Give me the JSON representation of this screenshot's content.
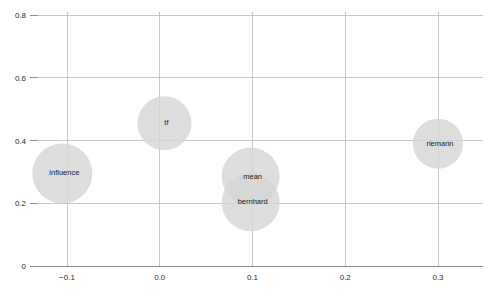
{
  "chart_data": {
    "type": "scatter",
    "title": "",
    "xlabel": "",
    "ylabel": "",
    "xlim": [
      -0.145,
      0.345
    ],
    "ylim": [
      0,
      0.845
    ],
    "grid": true,
    "legend": "none",
    "x_ticks": [
      -0.1,
      0.0,
      0.1,
      0.2,
      0.3
    ],
    "x_tick_labels": [
      "−0.1",
      "0.0",
      "0.1",
      "0.2",
      "0.3"
    ],
    "y_ticks": [
      0,
      0.2,
      0.4,
      0.6,
      0.8
    ],
    "y_tick_labels": [
      "0",
      "0.2",
      "0.4",
      "0.6",
      "0.8"
    ],
    "points": [
      {
        "label": "influence",
        "x": -0.105,
        "y": 0.295,
        "size": 30
      },
      {
        "label": "tf",
        "x": 0.005,
        "y": 0.455,
        "size": 27
      },
      {
        "label": "mean",
        "x": 0.098,
        "y": 0.285,
        "size": 29
      },
      {
        "label": "bernhard",
        "x": 0.098,
        "y": 0.203,
        "size": 29
      },
      {
        "label": "riemann",
        "x": 0.3,
        "y": 0.39,
        "size": 25
      }
    ],
    "bubble_color": "#d5d5d5",
    "gridline_color": "#b9b9b9",
    "axis_color": "#8f8f8f",
    "background_color": "#ffffff"
  },
  "caption": {
    "text": "——  ····················  ······  ···"
  }
}
